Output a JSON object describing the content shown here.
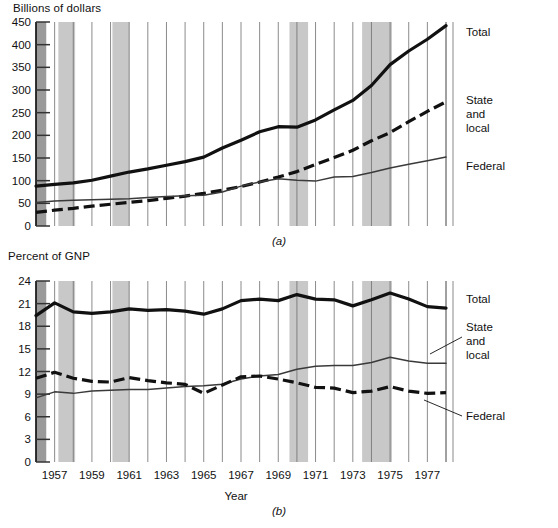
{
  "figure": {
    "panel_a_letter": "(a)",
    "panel_b_letter": "(b)",
    "xlabel": "Year"
  },
  "chart_data": [
    {
      "id": "panel_a",
      "type": "line",
      "title": "",
      "ylabel": "Billions of dollars",
      "xlabel": "",
      "ylim": [
        0,
        450
      ],
      "yticks": [
        0,
        50,
        100,
        150,
        200,
        250,
        300,
        350,
        400,
        450
      ],
      "ytick_labels": [
        "0",
        "50",
        "100",
        "150",
        "200",
        "250",
        "300",
        "350",
        "400",
        "450"
      ],
      "xlim": [
        1956,
        1978
      ],
      "xticks": [
        1957,
        1959,
        1961,
        1963,
        1965,
        1967,
        1969,
        1971,
        1973,
        1975,
        1977
      ],
      "xtick_labels": [
        "1957",
        "1959",
        "1961",
        "1963",
        "1965",
        "1967",
        "1969",
        "1971",
        "1973",
        "1975",
        "1977"
      ],
      "grid": true,
      "legend_position": "right-inline",
      "x": [
        1956,
        1957,
        1958,
        1959,
        1960,
        1961,
        1962,
        1963,
        1964,
        1965,
        1966,
        1967,
        1968,
        1969,
        1970,
        1971,
        1972,
        1973,
        1974,
        1975,
        1976,
        1977,
        1978
      ],
      "series": [
        {
          "name": "Total",
          "style": "thick-solid",
          "values": [
            88,
            92,
            95,
            101,
            110,
            119,
            126,
            134,
            142,
            152,
            172,
            189,
            208,
            219,
            218,
            234,
            256,
            277,
            310,
            356,
            386,
            412,
            442
          ]
        },
        {
          "name": "State and local",
          "style": "thick-dashed",
          "values": [
            30,
            35,
            39,
            44,
            48,
            52,
            56,
            61,
            66,
            72,
            79,
            87,
            97,
            108,
            120,
            136,
            151,
            167,
            188,
            206,
            230,
            253,
            274
          ]
        },
        {
          "name": "Federal",
          "style": "thin-solid",
          "values": [
            52,
            55,
            57,
            58,
            59,
            60,
            63,
            65,
            67,
            68,
            75,
            88,
            97,
            104,
            101,
            99,
            108,
            109,
            118,
            128,
            136,
            144,
            152
          ]
        }
      ],
      "recession_bands": [
        {
          "start": 1956.0,
          "end": 1956.55,
          "shade": "dark"
        },
        {
          "start": 1957.2,
          "end": 1958.1,
          "shade": "light"
        },
        {
          "start": 1960.1,
          "end": 1961.0,
          "shade": "light"
        },
        {
          "start": 1969.6,
          "end": 1970.6,
          "shade": "light"
        },
        {
          "start": 1973.5,
          "end": 1975.1,
          "shade": "light"
        }
      ]
    },
    {
      "id": "panel_b",
      "type": "line",
      "title": "",
      "ylabel": "Percent of GNP",
      "xlabel": "Year",
      "ylim": [
        0,
        24
      ],
      "yticks": [
        0,
        3,
        6,
        9,
        12,
        15,
        18,
        21,
        24
      ],
      "ytick_labels": [
        "0",
        "3",
        "6",
        "9",
        "12",
        "15",
        "18",
        "21",
        "24"
      ],
      "xlim": [
        1956,
        1978
      ],
      "xticks": [
        1957,
        1959,
        1961,
        1963,
        1965,
        1967,
        1969,
        1971,
        1973,
        1975,
        1977
      ],
      "xtick_labels": [
        "1957",
        "1959",
        "1961",
        "1963",
        "1965",
        "1967",
        "1969",
        "1971",
        "1973",
        "1975",
        "1977"
      ],
      "grid": true,
      "legend_position": "right-inline",
      "x": [
        1956,
        1957,
        1958,
        1959,
        1960,
        1961,
        1962,
        1963,
        1964,
        1965,
        1966,
        1967,
        1968,
        1969,
        1970,
        1971,
        1972,
        1973,
        1974,
        1975,
        1976,
        1977,
        1978
      ],
      "series": [
        {
          "name": "Total",
          "style": "thick-solid",
          "values": [
            19.4,
            21.1,
            19.9,
            19.7,
            19.9,
            20.3,
            20.1,
            20.2,
            20.0,
            19.6,
            20.3,
            21.4,
            21.6,
            21.4,
            22.2,
            21.6,
            21.5,
            20.7,
            21.5,
            22.4,
            21.6,
            20.6,
            20.4
          ]
        },
        {
          "name": "State and local",
          "style": "thin-solid",
          "values": [
            8.5,
            9.3,
            9.1,
            9.4,
            9.5,
            9.6,
            9.6,
            9.8,
            10.0,
            10.1,
            10.3,
            11.0,
            11.4,
            11.6,
            12.3,
            12.7,
            12.8,
            12.8,
            13.2,
            13.9,
            13.4,
            13.1,
            13.1
          ]
        },
        {
          "name": "Federal",
          "style": "thick-dashed",
          "values": [
            11.1,
            11.9,
            11.1,
            10.7,
            10.6,
            11.2,
            10.8,
            10.5,
            10.3,
            9.1,
            10.2,
            11.3,
            11.4,
            11.0,
            10.5,
            9.9,
            9.8,
            9.2,
            9.4,
            10.0,
            9.4,
            9.1,
            9.2
          ]
        }
      ],
      "recession_bands": [
        {
          "start": 1956.0,
          "end": 1956.55,
          "shade": "dark"
        },
        {
          "start": 1957.2,
          "end": 1958.1,
          "shade": "light"
        },
        {
          "start": 1960.1,
          "end": 1961.0,
          "shade": "light"
        },
        {
          "start": 1969.6,
          "end": 1970.6,
          "shade": "light"
        },
        {
          "start": 1973.5,
          "end": 1975.1,
          "shade": "light"
        }
      ]
    }
  ]
}
